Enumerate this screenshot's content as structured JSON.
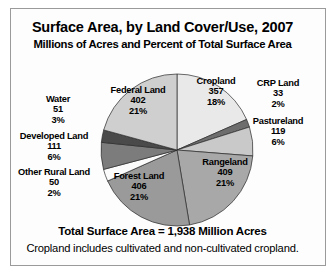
{
  "chart_data": {
    "type": "pie",
    "title": "Surface Area, by Land Cover/Use, 2007",
    "subtitle": "Millions of Acres and Percent of Total Surface Area",
    "unit": "Millions of Acres",
    "total": "1,938",
    "footer_total": "Total Surface Area = 1,938 Million Acres",
    "footer_note": "Cropland includes cultivated and non-cultivated cropland.",
    "categories": [
      "Cropland",
      "CRP Land",
      "Pastureland",
      "Rangeland",
      "Forest Land",
      "Other Rural Land",
      "Developed Land",
      "Water",
      "Federal Land"
    ],
    "values": [
      357,
      33,
      119,
      409,
      406,
      50,
      111,
      51,
      402
    ],
    "percents": [
      18,
      2,
      6,
      21,
      21,
      2,
      6,
      3,
      21
    ],
    "legend_position": "none",
    "grid": false,
    "slices": [
      {
        "name": "Cropland",
        "value": "357",
        "percent": "18%",
        "color": "#e9e9e9",
        "start": 0,
        "sweep": 66.3
      },
      {
        "name": "CRP Land",
        "value": "33",
        "percent": "2%",
        "color": "#6d6d6d",
        "start": 66.3,
        "sweep": 6.1
      },
      {
        "name": "Pastureland",
        "value": "119",
        "percent": "6%",
        "color": "#c9c9c9",
        "start": 72.4,
        "sweep": 22.1
      },
      {
        "name": "Rangeland",
        "value": "409",
        "percent": "21%",
        "color": "#a8a8a8",
        "start": 94.5,
        "sweep": 76.0
      },
      {
        "name": "Forest Land",
        "value": "406",
        "percent": "21%",
        "color": "#9a9a9a",
        "start": 170.5,
        "sweep": 75.4
      },
      {
        "name": "Other Rural Land",
        "value": "50",
        "percent": "2%",
        "color": "#fbfbfb",
        "start": 245.9,
        "sweep": 9.3
      },
      {
        "name": "Developed Land",
        "value": "111",
        "percent": "6%",
        "color": "#7c7c7c",
        "start": 255.2,
        "sweep": 20.6
      },
      {
        "name": "Water",
        "value": "51",
        "percent": "3%",
        "color": "#4a4a4a",
        "start": 275.8,
        "sweep": 9.5
      },
      {
        "name": "Federal Land",
        "value": "402",
        "percent": "21%",
        "color": "#cfcfcf",
        "start": 285.3,
        "sweep": 74.7
      }
    ]
  }
}
